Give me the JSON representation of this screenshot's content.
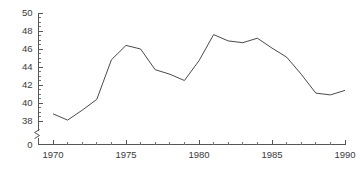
{
  "chart_data": {
    "type": "line",
    "title": "",
    "subtitle": "",
    "xlabel": "",
    "ylabel": "",
    "grid": false,
    "legend": null,
    "axis_break": {
      "axis": "y",
      "between": [
        0,
        38
      ],
      "marker": "zigzag"
    },
    "xlim": [
      1970,
      1990
    ],
    "ylim": [
      38,
      50
    ],
    "y_tick_labels": [
      "50",
      "48",
      "46",
      "44",
      "42",
      "40",
      "38",
      "0"
    ],
    "y_ticks": [
      50,
      48,
      46,
      44,
      42,
      40,
      38,
      0
    ],
    "y_minor_tick_step": 0.5,
    "x_tick_labels": [
      "1970",
      "1975",
      "1980",
      "1985",
      "1990"
    ],
    "x_ticks": [
      1970,
      1975,
      1980,
      1985,
      1990
    ],
    "x_minor_tick_step": 1,
    "x": [
      1970,
      1971,
      1972,
      1973,
      1974,
      1975,
      1976,
      1977,
      1978,
      1979,
      1980,
      1981,
      1982,
      1983,
      1984,
      1985,
      1986,
      1987,
      1988,
      1989,
      1990
    ],
    "values": [
      38.8,
      38.1,
      39.2,
      40.4,
      44.8,
      46.4,
      46.0,
      43.7,
      43.2,
      42.5,
      44.7,
      47.6,
      46.9,
      46.7,
      47.2,
      46.1,
      45.1,
      43.2,
      41.1,
      40.9,
      41.4
    ],
    "series": [
      {
        "name": "series-1",
        "values": [
          38.8,
          38.1,
          39.2,
          40.4,
          44.8,
          46.4,
          46.0,
          43.7,
          43.2,
          42.5,
          44.7,
          47.6,
          46.9,
          46.7,
          47.2,
          46.1,
          45.1,
          43.2,
          41.1,
          40.9,
          41.4
        ]
      }
    ],
    "colors": {
      "line": "#4a4a4a",
      "axis": "#555555",
      "text": "#3a3a3a",
      "background": "#ffffff"
    }
  }
}
